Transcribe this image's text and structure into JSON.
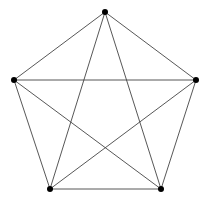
{
  "diagram": {
    "type": "complete-graph",
    "name": "K5",
    "colors": {
      "edge": "#444444",
      "node": "#000000",
      "background": "#ffffff"
    },
    "nodes": [
      {
        "id": "top",
        "x": 105,
        "y": 12
      },
      {
        "id": "right",
        "x": 196,
        "y": 80
      },
      {
        "id": "bottom-right",
        "x": 161,
        "y": 189
      },
      {
        "id": "bottom-left",
        "x": 50,
        "y": 189
      },
      {
        "id": "left",
        "x": 14,
        "y": 80
      }
    ],
    "edges": [
      [
        "top",
        "right"
      ],
      [
        "top",
        "bottom-right"
      ],
      [
        "top",
        "bottom-left"
      ],
      [
        "top",
        "left"
      ],
      [
        "right",
        "bottom-right"
      ],
      [
        "right",
        "bottom-left"
      ],
      [
        "right",
        "left"
      ],
      [
        "bottom-right",
        "bottom-left"
      ],
      [
        "bottom-right",
        "left"
      ],
      [
        "bottom-left",
        "left"
      ]
    ]
  }
}
